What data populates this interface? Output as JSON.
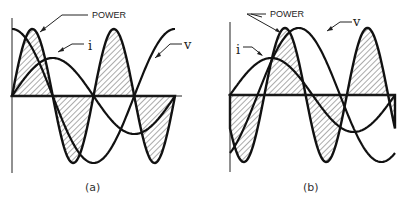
{
  "diagram": {
    "panels": [
      {
        "id": "a",
        "caption": "(a)",
        "axis": {
          "x0": 12,
          "x1": 182,
          "y0": 96,
          "ytop": 18,
          "ybottom": 173
        },
        "period_px": 163,
        "voltage": {
          "amp": 67,
          "phase_deg": 90,
          "label": "v"
        },
        "current": {
          "amp": 38,
          "phase_deg": 0,
          "label": "i"
        },
        "power": {
          "amp": 67,
          "phase_deg": 0,
          "label": "POWER"
        },
        "labels": {
          "power_text": {
            "text": "POWER",
            "x": 92,
            "y": 18
          },
          "i_text": {
            "text": "i",
            "x": 87,
            "y": 50
          },
          "v_text": {
            "text": "v",
            "x": 186,
            "y": 48
          }
        }
      },
      {
        "id": "b",
        "caption": "(b)",
        "axis": {
          "x0": 230,
          "x1": 396,
          "y0": 95,
          "ytop": 22,
          "ybottom": 172
        },
        "period_px": 165,
        "voltage": {
          "amp": 67,
          "phase_deg": -60,
          "label": "v"
        },
        "current": {
          "amp": 37,
          "phase_deg": 0,
          "label": "i"
        },
        "power": {
          "amp": 67,
          "phase_deg": 0,
          "label": "POWER"
        },
        "labels": {
          "power_text": {
            "text": "POWER",
            "x": 270,
            "y": 17
          },
          "i_text": {
            "text": "i",
            "x": 236,
            "y": 56
          },
          "v_text": {
            "text": "v",
            "x": 353,
            "y": 27
          }
        }
      }
    ]
  }
}
